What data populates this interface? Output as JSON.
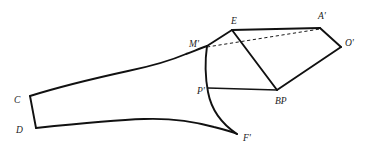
{
  "figure": {
    "title": "",
    "background_color": "#ffffff",
    "stroke_color": "#111111",
    "dashed_stroke_color": "#1a1a1a",
    "width": 367,
    "height": 157,
    "labels": [
      {
        "id": "C",
        "text": "C",
        "x": 14,
        "y": 103
      },
      {
        "id": "D",
        "text": "D",
        "x": 16,
        "y": 133
      },
      {
        "id": "Mp",
        "text": "M'",
        "x": 189,
        "y": 47
      },
      {
        "id": "E",
        "text": "E",
        "x": 231,
        "y": 24
      },
      {
        "id": "Ap",
        "text": "A'",
        "x": 318,
        "y": 19
      },
      {
        "id": "Op",
        "text": "O'",
        "x": 345,
        "y": 46
      },
      {
        "id": "Pp",
        "text": "P'",
        "x": 197,
        "y": 94
      },
      {
        "id": "BP",
        "text": "BP",
        "x": 275,
        "y": 104
      },
      {
        "id": "Fp",
        "text": "F'",
        "x": 243,
        "y": 141
      }
    ],
    "vertices": {
      "C": [
        30,
        96
      ],
      "D": [
        36,
        128
      ],
      "Mp": [
        207,
        46
      ],
      "E": [
        232,
        30
      ],
      "Ap": [
        320,
        28
      ],
      "Op": [
        341,
        47
      ],
      "Pp": [
        208,
        88
      ],
      "BP": [
        277,
        90
      ],
      "Fp": [
        237,
        134
      ]
    },
    "segments": [
      {
        "name": "edge-E-Ap",
        "from": "E",
        "to": "Ap",
        "style": "solid"
      },
      {
        "name": "edge-Ap-Op",
        "from": "Ap",
        "to": "Op",
        "style": "solid"
      },
      {
        "name": "edge-Op-BP",
        "from": "Op",
        "to": "BP",
        "style": "solid"
      },
      {
        "name": "edge-E-BP",
        "from": "E",
        "to": "BP",
        "style": "solid"
      },
      {
        "name": "edge-Mp-E",
        "from": "Mp",
        "to": "E",
        "style": "solid"
      },
      {
        "name": "edge-Mp-Pp",
        "from": "Mp",
        "to": "Pp",
        "style": "solid"
      },
      {
        "name": "edge-Pp-BP",
        "from": "Pp",
        "to": "BP",
        "style": "solid"
      },
      {
        "name": "edge-Mp-Ap",
        "from": "Mp",
        "to": "Ap",
        "style": "dashed"
      }
    ],
    "curves": [
      {
        "name": "upper-body-outline",
        "description": "C to M' upper contour"
      },
      {
        "name": "lower-body-outline",
        "description": "D to F' lower contour"
      },
      {
        "name": "cd-end-edge",
        "description": "C to D straight end"
      },
      {
        "name": "mp-to-fp-curve",
        "description": "M' down through P' to F'"
      }
    ]
  }
}
